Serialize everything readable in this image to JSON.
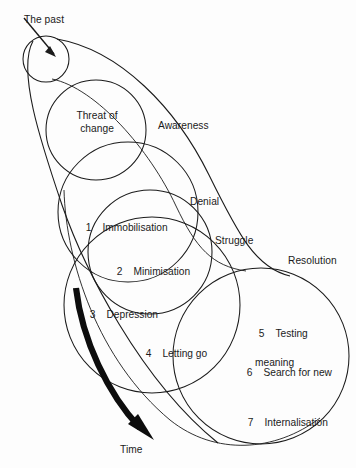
{
  "diagram": {
    "type": "concentric-circles-transition-model",
    "background_color": "#fdfdfd",
    "line_color": "#1b1b1b",
    "labels": {
      "the_past": "The past",
      "threat_line1": "Threat of",
      "threat_line2": "change",
      "awareness": "Awareness",
      "denial": "Denial",
      "struggle": "Struggle",
      "resolution": "Resolution",
      "time": "Time"
    },
    "stages": [
      {
        "number": "1",
        "label": "Immobilisation"
      },
      {
        "number": "2",
        "label": "Minimisation"
      },
      {
        "number": "3",
        "label": "Depression"
      },
      {
        "number": "4",
        "label": "Letting go"
      },
      {
        "number": "5",
        "label": "Testing"
      },
      {
        "number": "6",
        "label": "Search for new",
        "label_line2": "meaning"
      },
      {
        "number": "7",
        "label": "Internalisation"
      }
    ],
    "phases": [
      "Awareness",
      "Denial",
      "Struggle",
      "Resolution"
    ],
    "axis": {
      "arrow_label": "Time",
      "direction": "down-right"
    }
  }
}
